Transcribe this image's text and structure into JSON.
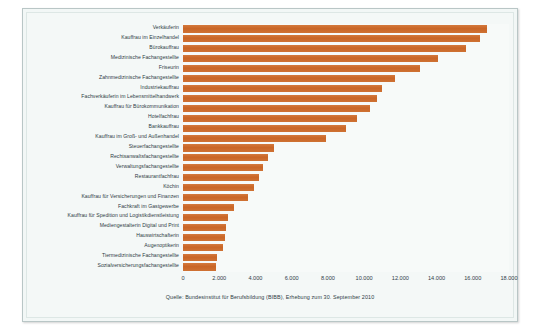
{
  "chart_data": {
    "type": "bar",
    "orientation": "horizontal",
    "title": "",
    "subtitle": "",
    "xlabel": "",
    "ylabel": "",
    "xlim": [
      0,
      18000
    ],
    "grid": false,
    "legend": null,
    "bar_color": "#cf7033",
    "plot_background": "#f7faf9",
    "panel_background": "#f2f7f6",
    "xticks": [
      0,
      2000,
      4000,
      6000,
      8000,
      10000,
      12000,
      14000,
      16000,
      18000
    ],
    "xticklabels": [
      "0",
      "2.000",
      "4.000",
      "6.000",
      "8.000",
      "10.000",
      "12.000",
      "14.000",
      "16.000",
      "18.000"
    ],
    "categories": [
      "Verkäuferin",
      "Kauffrau im Einzelhandel",
      "Bürokauffrau",
      "Medizinische Fachangestellte",
      "Friseurin",
      "Zahnmedizinische Fachangestellte",
      "Industriekauffrau",
      "Fachverkäuferin im Lebensmittelhandwerk",
      "Kauffrau für Bürokommunikation",
      "Hotelfachfrau",
      "Bankkauffrau",
      "Kauffrau im Groß- und Außenhandel",
      "Steuerfachangestellte",
      "Rechtsanwaltsfachangestellte",
      "Verwaltungsfachangestellte",
      "Restaurantfachfrau",
      "Köchin",
      "Kauffrau für Versicherungen und Finanzen",
      "Fachkraft im Gastgewerbe",
      "Kauffrau für Spedition und Logistikdienstleistung",
      "Mediengestalterin Digital und Print",
      "Hauswirtschafterin",
      "Augenoptikerin",
      "Tiermedizinische Fachangestellte",
      "Sozialversicherungsfachangestellte"
    ],
    "values": [
      16800,
      16400,
      15600,
      14100,
      13100,
      11700,
      11000,
      10700,
      10300,
      9600,
      9000,
      7900,
      5000,
      4700,
      4400,
      4200,
      3900,
      3600,
      2800,
      2500,
      2400,
      2300,
      2200,
      1900,
      1800
    ],
    "caption": "Quelle: Bundesinstitut für Berufsbildung (BIBB), Erhebung zum 30. September 2010"
  }
}
